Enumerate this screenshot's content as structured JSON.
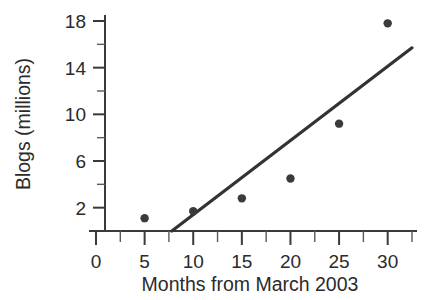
{
  "chart_data": {
    "type": "scatter",
    "title": "",
    "xlabel": "Months from March 2003",
    "ylabel": "Blogs (millions)",
    "xlim": [
      0,
      32.5
    ],
    "ylim": [
      0,
      19.5
    ],
    "grid": false,
    "legend": null,
    "x_ticks": [
      0,
      5,
      10,
      15,
      20,
      25,
      30
    ],
    "x_tick_labels": [
      "0",
      "5",
      "10",
      "15",
      "20",
      "25",
      "30"
    ],
    "x_minor_ticks": [
      2.5,
      7.5,
      12.5,
      17.5,
      22.5,
      27.5,
      32.5
    ],
    "y_ticks": [
      2,
      6,
      10,
      14,
      18
    ],
    "y_tick_labels": [
      "2",
      "6",
      "10",
      "14",
      "18"
    ],
    "y_minor_ticks": [
      4,
      8,
      12,
      16
    ],
    "points": [
      {
        "x": 5,
        "y": 1.1
      },
      {
        "x": 10,
        "y": 1.7
      },
      {
        "x": 15,
        "y": 2.8
      },
      {
        "x": 20,
        "y": 4.5
      },
      {
        "x": 25,
        "y": 9.2
      },
      {
        "x": 30,
        "y": 17.8
      }
    ],
    "x": [
      5,
      10,
      15,
      20,
      25,
      30
    ],
    "values": [
      1.1,
      1.7,
      2.8,
      4.5,
      9.2,
      17.8
    ],
    "series": [
      {
        "name": "Blogs",
        "type": "scatter",
        "x": [
          5,
          10,
          15,
          20,
          25,
          30
        ],
        "values": [
          1.1,
          1.7,
          2.8,
          4.5,
          9.2,
          17.8
        ]
      },
      {
        "name": "Trend line",
        "type": "line",
        "x": [
          7.8,
          32.5
        ],
        "values": [
          0,
          15.7
        ]
      }
    ],
    "trend_line": {
      "x0": 7.8,
      "y0": 0,
      "x1": 32.5,
      "y1": 15.7
    },
    "marker_color": "#3b3b3b",
    "line_color": "#333333",
    "axis_color": "#3a3a3a",
    "background_color": "#ffffff"
  },
  "labels": {
    "x_axis_title": "Months from March 2003",
    "y_axis_title": "Blogs (millions)"
  }
}
